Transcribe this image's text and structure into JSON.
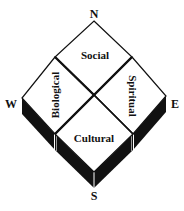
{
  "diagram": {
    "type": "four-quadrant diamond with compass directions",
    "compass": {
      "north": "N",
      "east": "E",
      "south": "S",
      "west": "W"
    },
    "quadrants": {
      "top": "Social",
      "left": "Biological",
      "right": "Spiritual",
      "bottom": "Cultural"
    },
    "colors": {
      "fill": "#ffffff",
      "stroke": "#111111",
      "shadow": "#111111",
      "highlight": "#ffffff"
    }
  }
}
